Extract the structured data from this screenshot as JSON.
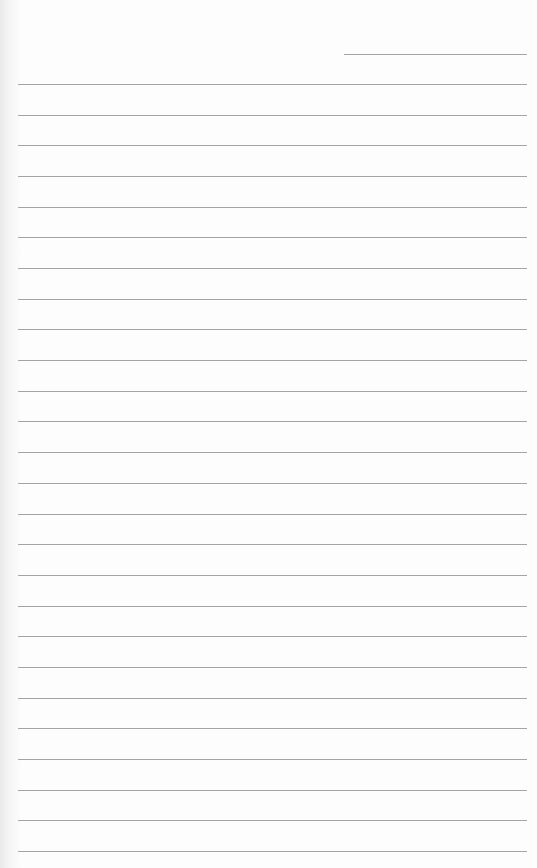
{
  "page": {
    "type": "lined-paper",
    "background_color": "#fdfdfd",
    "line_color": "#a4a4a4",
    "header_line": {
      "top": 54,
      "left": 344,
      "width": 183
    },
    "ruled_lines": {
      "count": 26,
      "first_top": 84,
      "spacing": 30.68,
      "left": 18,
      "width": 509
    }
  }
}
